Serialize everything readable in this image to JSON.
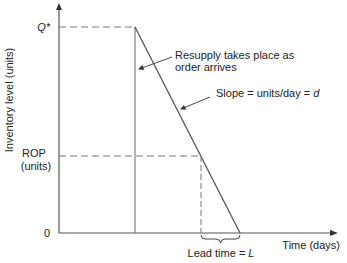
{
  "diagram": {
    "y_axis_label": "Inventory level (units)",
    "x_axis_label": "Time (days)",
    "y_ticks": {
      "q_star": "Q*",
      "rop_line1": "ROP",
      "rop_line2": "(units)",
      "zero": "0"
    },
    "annotations": {
      "resupply_line1": "Resupply takes place as",
      "resupply_line2": "order arrives",
      "slope": "Slope = units/day = ",
      "slope_var": "d",
      "lead_time": "Lead time = ",
      "lead_time_var": "L"
    },
    "colors": {
      "line": "#555555",
      "dash": "#777777",
      "text": "#222222"
    }
  }
}
